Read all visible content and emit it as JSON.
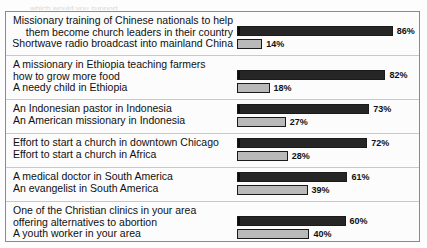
{
  "top_partial_text": "which would you support",
  "chart_data": {
    "type": "bar",
    "title": "",
    "subtitle": "",
    "xlabel": "",
    "ylabel": "",
    "xlim": [
      0,
      100
    ],
    "grid": false,
    "legend_position": "none",
    "value_suffix": "%",
    "axis_full_scale_percent": 100,
    "groups": [
      {
        "top_label": "Missionary training of Chinese nationals to help\nthem become church leaders in their country",
        "bottom_label": "Shortwave radio broadcast into mainland China",
        "top_value": 86,
        "bottom_value": 14,
        "top_value_label": "86%",
        "bottom_value_label": "14%",
        "label_align": "right"
      },
      {
        "top_label": "A missionary in Ethiopia teaching farmers\nhow to grow more food",
        "bottom_label": "A needy child in Ethiopia",
        "top_value": 82,
        "bottom_value": 18,
        "top_value_label": "82%",
        "bottom_value_label": "18%",
        "label_align": "left"
      },
      {
        "top_label": "An Indonesian pastor in Indonesia",
        "bottom_label": "An American missionary in Indonesia",
        "top_value": 73,
        "bottom_value": 27,
        "top_value_label": "73%",
        "bottom_value_label": "27%",
        "label_align": "left"
      },
      {
        "top_label": "Effort to start a church in downtown Chicago",
        "bottom_label": "Effort to start a church in Africa",
        "top_value": 72,
        "bottom_value": 28,
        "top_value_label": "72%",
        "bottom_value_label": "28%",
        "label_align": "left"
      },
      {
        "top_label": "A medical doctor in South America",
        "bottom_label": "An evangelist in South America",
        "top_value": 61,
        "bottom_value": 39,
        "top_value_label": "61%",
        "bottom_value_label": "39%",
        "label_align": "left"
      },
      {
        "top_label": "One of the Christian clinics in your area\noffering alternatives to abortion",
        "bottom_label": "A youth worker in your area",
        "top_value": 60,
        "bottom_value": 40,
        "top_value_label": "60%",
        "bottom_value_label": "40%",
        "label_align": "left"
      },
      {
        "top_label": "Bible school teacher in Nigeria",
        "bottom_label": "Bible translator in Nigeria",
        "top_value": 55,
        "bottom_value": 45,
        "top_value_label": "55%",
        "bottom_value_label": "45%",
        "label_align": "left"
      }
    ],
    "colors": {
      "top_bar": "#121212",
      "bottom_bar": "#b9b9b9",
      "bar_border": "#1a1a1a",
      "separator": "#c9c9c9",
      "frame": "#8a8a8a",
      "text": "#101010",
      "background": "#fcfcfc"
    }
  }
}
